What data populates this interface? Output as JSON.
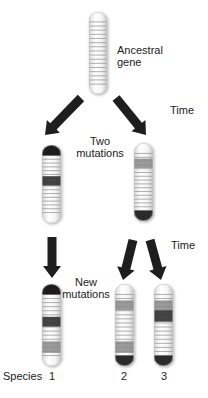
{
  "labels": {
    "ancestral": [
      "Ancestral",
      "gene"
    ],
    "time_1": "Time",
    "two_mutations": [
      "Two",
      "mutations"
    ],
    "time_2": "Time",
    "new_mutations": [
      "New",
      "mutations"
    ],
    "species_label": "Species",
    "species_numbers": [
      "1",
      "2",
      "3"
    ]
  },
  "colors": {
    "arrow": "#1e1e1e",
    "dark_band": "#3a3a3a",
    "mid_band": "#8a8a8a",
    "line_band": "#9a9a9a",
    "chromosome_fill": "#f6f6f6"
  },
  "chromosomes": [
    {
      "id": "ancestral-gene",
      "top_cap": "light",
      "bottom_cap": "light",
      "mutations": []
    },
    {
      "id": "intermediate-left",
      "top_cap": "dark",
      "bottom_cap": "light",
      "mutations": [
        {
          "position": "middle",
          "shade": "dark"
        }
      ]
    },
    {
      "id": "intermediate-right",
      "top_cap": "light",
      "bottom_cap": "dark",
      "mutations": [
        {
          "position": "upper",
          "shade": "mid"
        }
      ]
    },
    {
      "id": "species-1",
      "top_cap": "dark",
      "bottom_cap": "light",
      "mutations": [
        {
          "position": "middle",
          "shade": "dark"
        },
        {
          "position": "lower",
          "shade": "mid"
        }
      ]
    },
    {
      "id": "species-2",
      "top_cap": "light",
      "bottom_cap": "dark",
      "mutations": [
        {
          "position": "upper",
          "shade": "mid"
        },
        {
          "position": "lower",
          "shade": "mid"
        }
      ]
    },
    {
      "id": "species-3",
      "top_cap": "light",
      "bottom_cap": "dark",
      "mutations": [
        {
          "position": "upper",
          "shade": "mid"
        },
        {
          "position": "upper2",
          "shade": "dark"
        }
      ]
    }
  ]
}
